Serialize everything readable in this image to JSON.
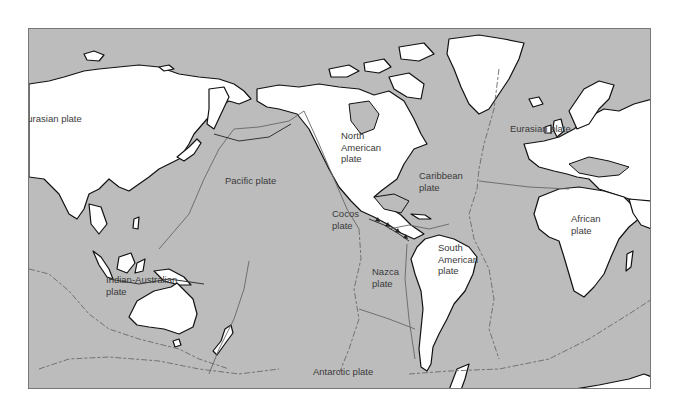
{
  "map": {
    "title": "Tectonic plates of the world",
    "colors": {
      "ocean": "#bcbcbc",
      "land": "#ffffff",
      "coastline": "#111111",
      "boundary": "#666666",
      "label": "#3a3a3a"
    },
    "labels": {
      "eurasian_west": "Eurasian plate",
      "eurasian_east": "Eurasian plate",
      "north_american": "North\nAmerican\nplate",
      "pacific": "Pacific plate",
      "caribbean": "Caribbean\nplate",
      "cocos": "Cocos\nplate",
      "african": "African\nplate",
      "south_american": "South\nAmerican\nplate",
      "nazca": "Nazca\nplate",
      "indian_australian": "Indian-Australian\nplate",
      "antarctic": "Antarctic plate"
    },
    "icons": {
      "subduction": "triangle-teeth",
      "ridge": "dashed-line"
    }
  }
}
